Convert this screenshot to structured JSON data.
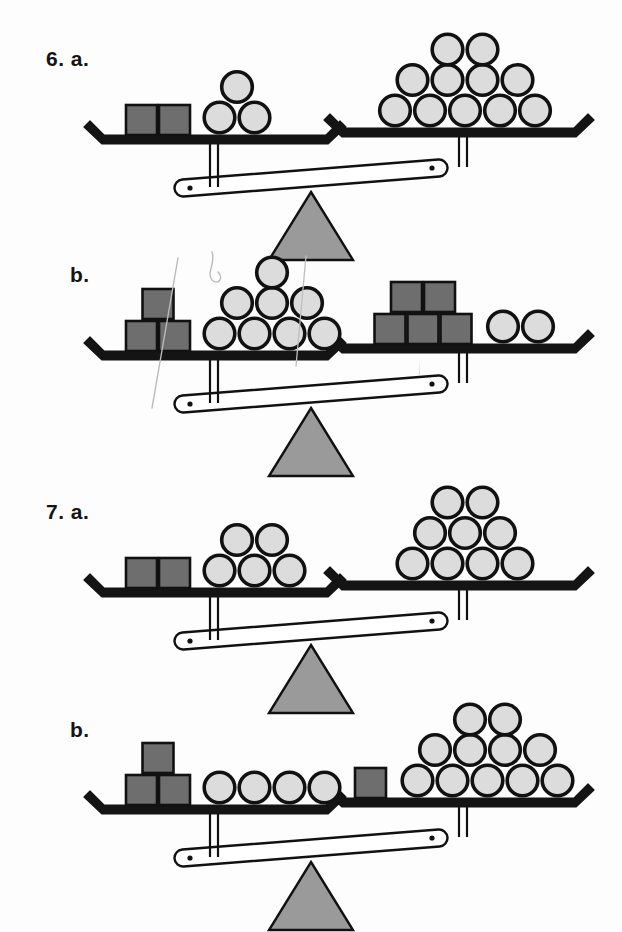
{
  "worksheet": {
    "title": "Balance scale problems 6 and 7",
    "background_color": "#fdfdfd"
  },
  "palette": {
    "ball_fill": "#dcdcdc",
    "ball_stroke": "#111111",
    "cube_fill": "#6e6e6e",
    "cube_stroke": "#111111",
    "pan_color": "#141414",
    "beam_fill": "#ffffff",
    "beam_stroke": "#111111",
    "fulcrum_fill": "#9a9a9a",
    "fulcrum_stroke": "#111111",
    "label_color": "#141414",
    "scribble_color": "#b9b6b2"
  },
  "problems": [
    {
      "id": "6a",
      "number_label": "6.",
      "part_label": "a.",
      "label_text": "6. a.",
      "label_x": 46,
      "label_y": 47,
      "origin_y": 30,
      "tilt": "left-down",
      "left_pan": {
        "cubes": 2,
        "balls": 3,
        "cube_layout": [
          2
        ],
        "ball_layout": [
          2,
          1
        ]
      },
      "right_pan": {
        "cubes": 0,
        "balls": 11,
        "cube_layout": [],
        "ball_layout": [
          5,
          4,
          2
        ]
      }
    },
    {
      "id": "6b",
      "number_label": "",
      "part_label": "b.",
      "label_text": "b.",
      "label_x": 70,
      "label_y": 263,
      "origin_y": 246,
      "tilt": "left-down",
      "left_pan": {
        "cubes": 3,
        "balls": 8,
        "cube_layout": [
          2,
          1
        ],
        "ball_layout": [
          4,
          3,
          1
        ]
      },
      "right_pan": {
        "cubes": 5,
        "balls": 2,
        "cube_layout": [
          3,
          2
        ],
        "ball_layout": [
          2
        ]
      }
    },
    {
      "id": "7a",
      "number_label": "7.",
      "part_label": "a.",
      "label_text": "7. a.",
      "label_x": 46,
      "label_y": 500,
      "origin_y": 483,
      "tilt": "left-down",
      "left_pan": {
        "cubes": 2,
        "balls": 5,
        "cube_layout": [
          2
        ],
        "ball_layout": [
          3,
          2
        ]
      },
      "right_pan": {
        "cubes": 0,
        "balls": 9,
        "cube_layout": [],
        "ball_layout": [
          4,
          3,
          2
        ]
      }
    },
    {
      "id": "7b",
      "number_label": "",
      "part_label": "b.",
      "label_text": "b.",
      "label_x": 70,
      "label_y": 718,
      "origin_y": 700,
      "tilt": "left-down",
      "left_pan": {
        "cubes": 3,
        "balls": 4,
        "cube_layout": [
          2,
          1
        ],
        "ball_layout": [
          4
        ]
      },
      "right_pan": {
        "cubes": 1,
        "balls": 11,
        "cube_layout": [
          1
        ],
        "ball_layout": [
          5,
          4,
          2
        ]
      }
    }
  ],
  "annotations": {
    "pencil_marks_present_on": [
      "6b"
    ],
    "count": 4
  }
}
